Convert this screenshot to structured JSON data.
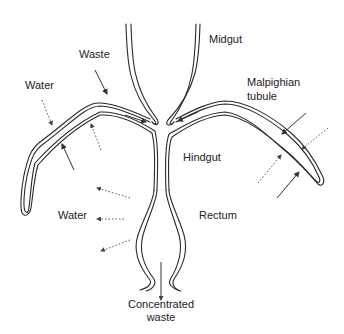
{
  "labels": {
    "midgut": "Midgut",
    "waste": "Waste",
    "water_upper": "Water",
    "malpighian_line1": "Malpighian",
    "malpighian_line2": "tubule",
    "hindgut": "Hindgut",
    "water_lower": "Water",
    "rectum": "Rectum",
    "concentrated_line1": "Concentrated",
    "concentrated_line2": "waste"
  },
  "legend": {
    "solid_arrow_meaning": "waste movement",
    "dotted_arrow_meaning": "water movement"
  },
  "colors": {
    "line": "#2a2a2a",
    "text": "#222222",
    "background": "#ffffff"
  }
}
